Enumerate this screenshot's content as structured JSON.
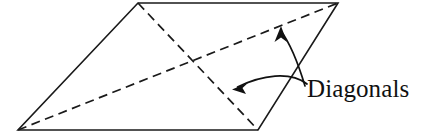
{
  "figure": {
    "background_color": "#ffffff",
    "ink_color": "#1a1a1a",
    "label": "Diagonals",
    "shape": {
      "name": "parallelogram",
      "vertices": [
        {
          "name": "top-left",
          "x": 138,
          "y": 3
        },
        {
          "name": "top-right",
          "x": 338,
          "y": 3
        },
        {
          "name": "bottom-right",
          "x": 258,
          "y": 130
        },
        {
          "name": "bottom-left",
          "x": 18,
          "y": 130
        }
      ],
      "edge_style": "solid",
      "edge_width": 1.6
    },
    "diagonals": [
      {
        "name": "diagonal-top-left-to-bottom-right",
        "from": {
          "x": 138,
          "y": 3
        },
        "to": {
          "x": 258,
          "y": 130
        },
        "style": "dashed"
      },
      {
        "name": "diagonal-bottom-left-to-top-right",
        "from": {
          "x": 18,
          "y": 130
        },
        "to": {
          "x": 338,
          "y": 3
        },
        "style": "dashed"
      }
    ],
    "leaders": [
      {
        "name": "leader-to-upper-diagonal",
        "path": "M 305 86 C 299 66 292 46 281 31",
        "arrow_points": "281,26 287,41 281,37 274,41",
        "target": "diagonal-bottom-left-to-top-right"
      },
      {
        "name": "leader-to-lower-diagonal",
        "path": "M 306 84 C 289 72 262 76 237 87",
        "arrow_points": "232,89 247,83 242,88 245,94",
        "target": "diagonal-top-left-to-bottom-right"
      }
    ],
    "label_position": {
      "x": 307,
      "y": 97
    }
  }
}
